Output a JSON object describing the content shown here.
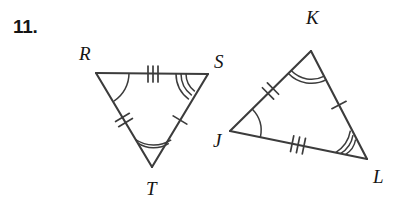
{
  "worksheet": {
    "problem_number": "11.",
    "background_color": "#ffffff",
    "ink_color": "#3c3c3c",
    "label_color": "#141414"
  },
  "figure": {
    "type": "congruent-triangles-pair",
    "triangles": [
      {
        "id": "RST",
        "name": "triangle-rst",
        "vertices": [
          {
            "name": "R",
            "label": "R",
            "x": 96,
            "y": 73,
            "label_x": 79,
            "label_y": 60,
            "angle_arcs": 1
          },
          {
            "name": "S",
            "label": "S",
            "x": 208,
            "y": 74,
            "label_x": 214,
            "label_y": 68,
            "angle_arcs": 3
          },
          {
            "name": "T",
            "label": "T",
            "x": 152,
            "y": 167,
            "label_x": 146,
            "label_y": 195,
            "angle_arcs": 2
          }
        ],
        "sides": [
          {
            "name": "RS",
            "from": "R",
            "to": "S",
            "ticks": 3
          },
          {
            "name": "ST",
            "from": "S",
            "to": "T",
            "ticks": 1
          },
          {
            "name": "RT",
            "from": "R",
            "to": "T",
            "ticks": 2
          }
        ]
      },
      {
        "id": "JKL",
        "name": "triangle-jkl",
        "vertices": [
          {
            "name": "K",
            "label": "K",
            "x": 311,
            "y": 51,
            "label_x": 306,
            "label_y": 24,
            "angle_arcs": 2
          },
          {
            "name": "J",
            "label": "J",
            "x": 230,
            "y": 131,
            "label_x": 213,
            "label_y": 147,
            "angle_arcs": 1
          },
          {
            "name": "L",
            "label": "L",
            "x": 367,
            "y": 159,
            "label_x": 373,
            "label_y": 183,
            "angle_arcs": 3
          }
        ],
        "sides": [
          {
            "name": "JK",
            "from": "J",
            "to": "K",
            "ticks": 2
          },
          {
            "name": "KL",
            "from": "K",
            "to": "L",
            "ticks": 1
          },
          {
            "name": "JL",
            "from": "J",
            "to": "L",
            "ticks": 3
          }
        ]
      }
    ],
    "correspondence": [
      {
        "left": "R",
        "right": "J",
        "marks": 1
      },
      {
        "left": "S",
        "right": "L",
        "marks": 3
      },
      {
        "left": "T",
        "right": "K",
        "marks": 2
      },
      {
        "left": "RS",
        "right": "JL",
        "marks": 3
      },
      {
        "left": "ST",
        "right": "KL",
        "marks": 1
      },
      {
        "left": "RT",
        "right": "JK",
        "marks": 2
      }
    ]
  }
}
